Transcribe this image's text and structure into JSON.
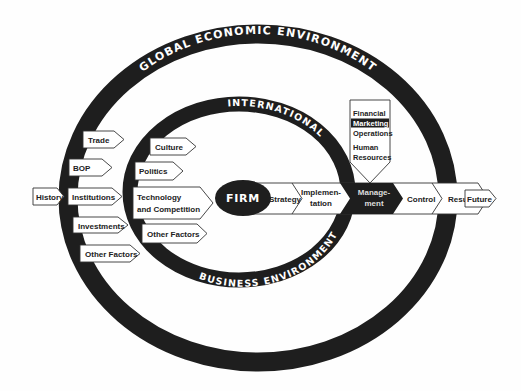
{
  "diagram": {
    "outer_ring": {
      "label": "GLOBAL ECONOMIC ENVIRONMENT"
    },
    "inner_ring": {
      "label_top": "INTERNATIONAL",
      "label_bottom": "BUSINESS ENVIRONMENT"
    },
    "core": {
      "label": "FIRM"
    },
    "outer_factors": [
      {
        "label": "Trade"
      },
      {
        "label": "BOP"
      },
      {
        "label": "Institutions"
      },
      {
        "label": "Investments"
      },
      {
        "label": "Other Factors"
      }
    ],
    "inner_factors": [
      {
        "label": "Culture"
      },
      {
        "label": "Politics"
      },
      {
        "label": "Technology",
        "label2": "and Competition"
      },
      {
        "label": "Other Factors"
      }
    ],
    "flow": {
      "history": "History",
      "strategy": "Strategy",
      "implementation": {
        "line1": "Implemen-",
        "line2": "tation"
      },
      "management": {
        "line1": "Manage-",
        "line2": "ment"
      },
      "control": "Control",
      "results": "Results",
      "future": "Future"
    },
    "functions": [
      {
        "label": "Financial",
        "highlighted": false
      },
      {
        "label": "Marketing",
        "highlighted": true
      },
      {
        "label": "Operations",
        "highlighted": false
      },
      {
        "label": "Human",
        "highlighted": false
      },
      {
        "label": "Resources",
        "highlighted": false
      }
    ],
    "colors": {
      "ring": "#1e1e1e",
      "box_fill": "#ffffff",
      "text": "#222222",
      "highlight": "#1e1e1e"
    }
  }
}
